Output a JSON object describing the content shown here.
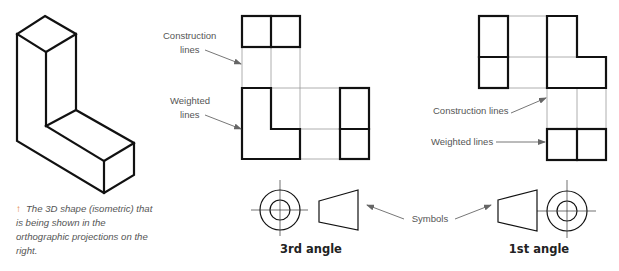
{
  "isometric": {
    "caption": "The 3D shape (isometric) that is being shown in the orthographic projections on the right.",
    "caption_icon": "up-arrow-icon",
    "caption_icon_glyph": "↑",
    "caption_icon_color": "#e0803a",
    "outline": "45,16 76,34 76,110 134,143 134,175 104,193 17,141 17,34",
    "edges": [
      "17,34 46,52",
      "46,52 76,34",
      "46,52 46,126",
      "46,126 76,110",
      "46,126 104,161",
      "104,161 134,143",
      "104,161 104,193"
    ]
  },
  "third_angle": {
    "title": "3rd angle",
    "title_x": 311,
    "title_y": 253,
    "labels": {
      "construction_line1": "Construction",
      "construction_line2": "lines",
      "weighted_line1": "Weighted",
      "weighted_line2": "lines"
    },
    "top_view": {
      "x": 242,
      "y": 16,
      "w": 58,
      "h": 31,
      "divider_x": 271
    },
    "front_view": "242,88 271,88 271,129 300,129 300,159 242,159",
    "side_view": {
      "x": 340,
      "y": 88,
      "w": 29,
      "h": 71,
      "divider_y": 129
    },
    "construction_lines": [
      "242,47 242,88",
      "271,47 271,88",
      "300,47 300,129",
      "271,88 340,88",
      "300,129 340,129",
      "300,159 340,159"
    ],
    "arrows": [
      {
        "from": "205,50",
        "to": "241,64"
      },
      {
        "from": "205,115",
        "to": "241,129"
      }
    ],
    "symbol": {
      "circle_cx": 280,
      "circle_cy": 210,
      "outer_r": 20,
      "inner_r": 10,
      "cross_h": "251,210 308,210",
      "cross_v": "280,180 280,236",
      "trapezoid": "319,201 358,190 358,230 319,222"
    }
  },
  "first_angle": {
    "title": "1st angle",
    "title_x": 539,
    "title_y": 253,
    "labels": {
      "construction": "Construction lines",
      "weighted": "Weighted lines"
    },
    "side_view": {
      "x": 479,
      "y": 16,
      "w": 29,
      "h": 72,
      "divider_y": 57
    },
    "front_view": "547,16 577,16 577,57 606,57 606,88 547,88",
    "top_view": {
      "x": 547,
      "y": 129,
      "w": 59,
      "h": 31,
      "divider_x": 577
    },
    "construction_lines": [
      "508,16 547,16",
      "508,57 577,57",
      "508,88 547,88",
      "547,88 547,129",
      "577,88 577,129",
      "606,88 606,129"
    ],
    "arrows": [
      {
        "from": "511,113",
        "to": "546,98"
      },
      {
        "from": "496,142",
        "to": "545,142"
      }
    ],
    "symbol": {
      "circle_cx": 567,
      "circle_cy": 211,
      "outer_r": 20,
      "inner_r": 10,
      "cross_h": "537,211 596,211",
      "cross_v": "567,180 567,238",
      "trapezoid": "498,200 537,190 537,231 498,222"
    }
  },
  "symbols_label": {
    "text": "Symbols",
    "x": 430,
    "y": 222,
    "arrows": [
      {
        "from": "404,219",
        "to": "367,205"
      },
      {
        "from": "455,219",
        "to": "491,205"
      }
    ]
  }
}
